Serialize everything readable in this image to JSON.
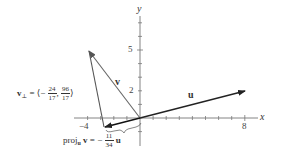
{
  "diagram": {
    "axes": {
      "x_label": "x",
      "y_label": "y",
      "x_ticks_labeled": [
        "−4",
        "8"
      ],
      "y_ticks_labeled": [
        "2",
        "5"
      ],
      "x_range": [
        -5,
        9
      ],
      "y_range": [
        -2,
        7
      ]
    },
    "vectors": [
      {
        "name": "u",
        "label": "u",
        "from": [
          0,
          0
        ],
        "to": [
          8,
          2
        ]
      },
      {
        "name": "v",
        "label": "v",
        "from": [
          0,
          0
        ],
        "to": [
          -4,
          5
        ]
      },
      {
        "name": "proj_u_v",
        "from": [
          0,
          0
        ],
        "to": [
          -2.59,
          -0.65
        ]
      },
      {
        "name": "v_perp",
        "from": [
          -2.59,
          -0.65
        ],
        "to": [
          -4,
          5
        ]
      }
    ],
    "labels": {
      "u": "u",
      "v": "v",
      "v_perp_prefix": "v",
      "v_perp_sub": "⊥",
      "v_perp_eq": "= ⟨−",
      "v_perp_x_num": "24",
      "v_perp_x_den": "17",
      "v_perp_comma": ",",
      "v_perp_y_num": "96",
      "v_perp_y_den": "17",
      "v_perp_close": "⟩",
      "proj_text": "proj",
      "proj_sub": "u",
      "proj_v": "v",
      "proj_eq": "= −",
      "proj_num": "11",
      "proj_den": "34",
      "proj_u": "u"
    },
    "colors": {
      "axis": "#555555",
      "vector_u": "#222222",
      "vector_v": "#555555",
      "proj": "#111111",
      "text": "#333333"
    }
  }
}
